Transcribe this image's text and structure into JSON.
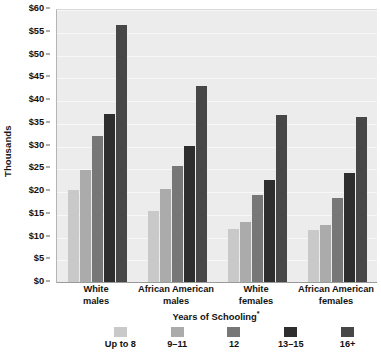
{
  "chart_data": {
    "type": "bar",
    "title": "",
    "xlabel": "Years of Schooling*",
    "xlabel_text": "Years of Schooling",
    "xlabel_superscript": "*",
    "ylabel": "Thousands",
    "ylim": [
      0,
      60
    ],
    "ytick_step": 5,
    "ytick_labels": [
      "$60",
      "$55",
      "$50",
      "$45",
      "$40",
      "$35",
      "$30",
      "$25",
      "$20",
      "$15",
      "$10",
      "$5",
      "$0"
    ],
    "ytick_values": [
      60,
      55,
      50,
      45,
      40,
      35,
      30,
      25,
      20,
      15,
      10,
      5,
      0
    ],
    "grid": true,
    "legend_position": "bottom",
    "categories": [
      "White males",
      "African American males",
      "White females",
      "African American females"
    ],
    "category_lines": [
      [
        "White",
        "males"
      ],
      [
        "African American",
        "males"
      ],
      [
        "White",
        "females"
      ],
      [
        "African American",
        "females"
      ]
    ],
    "series": [
      {
        "name": "Up to 8",
        "color": "#c9c9c9",
        "values": [
          20.3,
          15.5,
          11.7,
          11.5
        ]
      },
      {
        "name": "9–11",
        "color": "#ababab",
        "values": [
          24.7,
          20.5,
          13.3,
          12.5
        ]
      },
      {
        "name": "12",
        "color": "#777777",
        "values": [
          32.0,
          25.5,
          19.2,
          18.5
        ]
      },
      {
        "name": "13–15",
        "color": "#2e2e2e",
        "values": [
          37.0,
          30.0,
          22.5,
          24.0
        ]
      },
      {
        "name": "16+",
        "color": "#474747",
        "values": [
          56.5,
          43.0,
          36.7,
          36.2
        ]
      }
    ]
  },
  "colors": {
    "plot_background": "#ececec",
    "gridline": "#f7f7f7",
    "axis": "#9a9a9a",
    "text": "#111111"
  }
}
